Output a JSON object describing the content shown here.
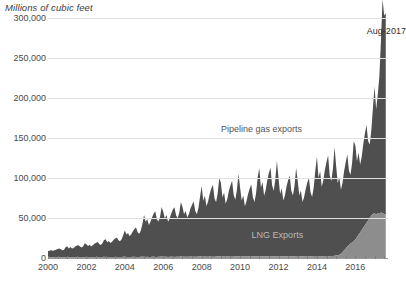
{
  "chart_data": {
    "type": "area",
    "stacked": true,
    "title": "Millions of cubic feet",
    "subtitle": "",
    "xlabel": "",
    "ylabel": "Millions of cubic feet",
    "ylim": [
      0,
      300000
    ],
    "ytick_values": [
      0,
      50000,
      100000,
      150000,
      200000,
      250000,
      300000
    ],
    "ytick_labels": [
      "0",
      "50,000",
      "100,000",
      "150,000",
      "200,000",
      "250,000",
      "300,000"
    ],
    "xlim": [
      2000.0,
      2017.7
    ],
    "xtick_values": [
      2000,
      2002,
      2004,
      2006,
      2008,
      2010,
      2012,
      2014,
      2016
    ],
    "xtick_labels": [
      "2000",
      "2002",
      "2004",
      "2006",
      "2008",
      "2010",
      "2012",
      "2014",
      "2016"
    ],
    "grid": true,
    "legend_position": "inline-annotations",
    "annotations": [
      {
        "text": "Pipeline gas exports",
        "x": 2009.0,
        "y": 160000,
        "color": "#545454"
      },
      {
        "text": "LNG Exports",
        "x": 2010.6,
        "y": 28000,
        "color": "#b9b9b9"
      },
      {
        "text": "Aug-2017",
        "x": 2016.6,
        "y": 283000,
        "color": "#2e2e2e"
      }
    ],
    "series": [
      {
        "name": "LNG Exports",
        "color": "#8d8d8d",
        "values": [
          1200,
          900,
          1100,
          1000,
          1300,
          1100,
          900,
          1000,
          1200,
          1100,
          1000,
          1300,
          1100,
          1000,
          1200,
          1000,
          1100,
          1300,
          1000,
          900,
          1100,
          1200,
          1000,
          1400,
          1300,
          1100,
          1200,
          1000,
          1100,
          1300,
          1200,
          1000,
          1100,
          1200,
          1300,
          1500,
          1400,
          1200,
          1300,
          1100,
          1200,
          1400,
          1300,
          1100,
          1200,
          1300,
          1400,
          1600,
          1500,
          1300,
          1400,
          1200,
          1300,
          1500,
          1400,
          1200,
          1300,
          1400,
          1500,
          1700,
          1600,
          1400,
          1500,
          1300,
          1400,
          1600,
          1500,
          1300,
          1400,
          1500,
          1600,
          1800,
          1700,
          1500,
          1600,
          1400,
          1500,
          1700,
          1600,
          1400,
          1500,
          1600,
          1700,
          1900,
          1800,
          1600,
          1700,
          1500,
          1600,
          1800,
          1700,
          1500,
          1600,
          1700,
          1800,
          2000,
          1900,
          1700,
          1800,
          1600,
          1700,
          1900,
          1800,
          1600,
          1700,
          1800,
          1900,
          2100,
          2000,
          1800,
          1900,
          1700,
          1800,
          2000,
          1900,
          1700,
          1800,
          1900,
          2000,
          2200,
          2100,
          1900,
          2000,
          1800,
          1900,
          2100,
          2000,
          1800,
          1900,
          2000,
          2100,
          2300,
          2200,
          2000,
          2100,
          1900,
          2000,
          2200,
          2100,
          1900,
          2000,
          2100,
          2200,
          2400,
          2300,
          2100,
          2200,
          2000,
          2100,
          2300,
          2200,
          2000,
          2100,
          2200,
          2300,
          2500,
          2400,
          2200,
          2300,
          2100,
          2200,
          2400,
          2300,
          2100,
          2200,
          2300,
          2400,
          2600,
          2500,
          2300,
          2400,
          2200,
          2300,
          2500,
          2400,
          2200,
          2300,
          2400,
          2600,
          2900,
          3200,
          3500,
          4200,
          5200,
          7500,
          9800,
          12000,
          14500,
          16000,
          18000,
          19500,
          21000,
          23000,
          26000,
          29000,
          32000,
          35000,
          38000,
          41000,
          44000,
          47000,
          50000,
          53000,
          55000,
          56000,
          54000,
          56000,
          55000,
          57000,
          56000,
          55000,
          54000
        ]
      },
      {
        "name": "Pipeline gas exports",
        "color": "#4f4f4f",
        "values": [
          7500,
          8200,
          9000,
          7800,
          8500,
          9200,
          10500,
          11000,
          9800,
          8600,
          9400,
          12000,
          13500,
          11000,
          12500,
          10800,
          11500,
          13000,
          14500,
          15000,
          13200,
          12000,
          13800,
          17000,
          16000,
          14000,
          15500,
          13500,
          14800,
          16500,
          18000,
          19000,
          16500,
          15000,
          17000,
          21000,
          22000,
          18500,
          20000,
          17500,
          19000,
          21500,
          23000,
          24500,
          21000,
          19500,
          22000,
          27000,
          33000,
          28000,
          30000,
          26000,
          28500,
          32000,
          35000,
          37000,
          31000,
          29000,
          33000,
          41000,
          52000,
          44000,
          47000,
          40000,
          44000,
          49000,
          54000,
          57000,
          47000,
          44000,
          50000,
          62000,
          56000,
          48000,
          52000,
          44000,
          48000,
          54000,
          59000,
          62000,
          52000,
          48000,
          55000,
          68000,
          62000,
          53000,
          57000,
          49000,
          53000,
          60000,
          65000,
          69000,
          57000,
          53000,
          61000,
          75000,
          88000,
          70000,
          76000,
          63000,
          69000,
          78000,
          85000,
          90000,
          73000,
          68000,
          79000,
          98000,
          92000,
          74000,
          80000,
          66000,
          72000,
          82000,
          89000,
          95000,
          77000,
          71000,
          83000,
          103000,
          86000,
          70000,
          76000,
          63000,
          69000,
          78000,
          85000,
          90000,
          74000,
          68000,
          79000,
          99000,
          110000,
          86000,
          93000,
          76000,
          83000,
          95000,
          104000,
          111000,
          89000,
          82000,
          96000,
          119000,
          98000,
          78000,
          85000,
          70000,
          76000,
          87000,
          95000,
          101000,
          82000,
          76000,
          88000,
          110000,
          94000,
          76000,
          82000,
          68000,
          74000,
          84000,
          92000,
          98000,
          80000,
          74000,
          86000,
          107000,
          124000,
          98000,
          106000,
          87000,
          95000,
          108000,
          118000,
          126000,
          101000,
          94000,
          109000,
          136000,
          112000,
          90000,
          97000,
          80000,
          87000,
          99000,
          108000,
          115000,
          93000,
          86000,
          100000,
          125000,
          118000,
          95000,
          103000,
          85000,
          92000,
          105000,
          115000,
          122000,
          99000,
          92000,
          107000,
          133000,
          158000,
          132000,
          148000,
          172000,
          215000,
          268000,
          248000,
          252000
        ]
      }
    ],
    "x_start_year": 2000,
    "x_step_months": 1,
    "peak_value": 268000,
    "peak_label": "Aug-2017",
    "caption_cut_off": true
  },
  "figure": {
    "background": "#ffffff",
    "grid_color": "#e2e2e2",
    "axis_color": "#9a9a9a",
    "tick_text_color": "#4a4a4a",
    "title_color": "#3d3d3d"
  }
}
